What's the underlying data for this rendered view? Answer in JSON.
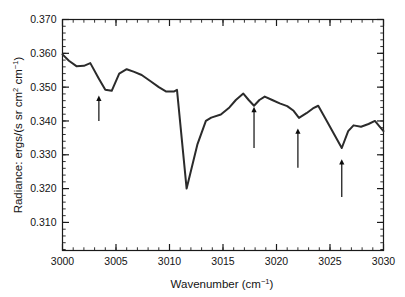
{
  "figure": {
    "background_color": "#ffffff",
    "frame_color": "#1a1a1a",
    "curve_color": "#2b2b2b",
    "arrow_color": "#0d0d0d"
  },
  "chart_data": {
    "type": "line",
    "title": "",
    "xlabel": "Wavenumber (cm⁻¹)",
    "xlabel_base": "Wavenumber (cm",
    "xlabel_sup": "−1",
    "xlabel_tail": ")",
    "ylabel": "Radiance: ergs/(s sr cm² cm⁻¹)",
    "ylabel_p1": "Radiance: ergs/(s sr cm",
    "ylabel_sup1": "2",
    "ylabel_p2": " cm",
    "ylabel_sup2": "−1",
    "ylabel_p3": ")",
    "xlim": [
      3000,
      3030
    ],
    "ylim": [
      0.3017,
      0.37
    ],
    "grid": false,
    "legend": null,
    "xticks": [
      3000,
      3005,
      3010,
      3015,
      3020,
      3025,
      3030
    ],
    "xtick_labels": [
      "3000",
      "3005",
      "3010",
      "3015",
      "3020",
      "3025",
      "3030"
    ],
    "xminor_step": 1,
    "yticks": [
      0.31,
      0.32,
      0.33,
      0.34,
      0.35,
      0.36,
      0.37
    ],
    "ytick_labels": [
      "0.310",
      "0.320",
      "0.330",
      "0.340",
      "0.350",
      "0.360",
      "0.370"
    ],
    "yminor_step": 0.002,
    "series": [
      {
        "name": "radiance-spectrum",
        "x": [
          3000.0,
          3000.6,
          3001.3,
          3002.0,
          3002.6,
          3003.4,
          3004.0,
          3004.6,
          3005.3,
          3006.0,
          3006.7,
          3007.4,
          3008.2,
          3009.0,
          3009.7,
          3010.4,
          3010.7,
          3011.6,
          3012.6,
          3013.4,
          3013.9,
          3014.8,
          3015.6,
          3016.2,
          3016.9,
          3017.4,
          3017.9,
          3018.4,
          3018.9,
          3019.6,
          3020.3,
          3021.0,
          3021.6,
          3022.1,
          3022.8,
          3023.4,
          3023.9,
          3024.7,
          3025.4,
          3026.1,
          3026.7,
          3027.2,
          3027.9,
          3028.6,
          3029.2,
          3029.6,
          3030.0
        ],
        "y": [
          0.3597,
          0.3578,
          0.3562,
          0.3563,
          0.3571,
          0.3525,
          0.3492,
          0.3489,
          0.354,
          0.3553,
          0.3545,
          0.3536,
          0.3518,
          0.35,
          0.3487,
          0.3487,
          0.3492,
          0.32,
          0.333,
          0.34,
          0.341,
          0.3419,
          0.344,
          0.3462,
          0.3481,
          0.3462,
          0.3445,
          0.3462,
          0.3472,
          0.3462,
          0.3452,
          0.3444,
          0.343,
          0.3409,
          0.3423,
          0.3437,
          0.3445,
          0.34,
          0.336,
          0.332,
          0.337,
          0.3387,
          0.3383,
          0.3391,
          0.34,
          0.3385,
          0.337
        ]
      }
    ],
    "annotations": [
      {
        "name": "arrow-3003",
        "x": 3003.4,
        "tip_y": 0.3475,
        "tail_y": 0.34,
        "label": ""
      },
      {
        "name": "arrow-3018",
        "x": 3017.9,
        "tip_y": 0.3442,
        "tail_y": 0.332,
        "label": ""
      },
      {
        "name": "arrow-3022",
        "x": 3022.0,
        "tip_y": 0.3378,
        "tail_y": 0.3262,
        "label": ""
      },
      {
        "name": "arrow-3026",
        "x": 3026.1,
        "tip_y": 0.3287,
        "tail_y": 0.3175,
        "label": ""
      }
    ]
  }
}
